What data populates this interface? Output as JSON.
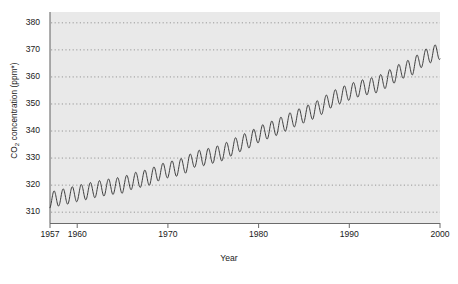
{
  "chart_data": {
    "type": "line",
    "title": "",
    "subtitle": "",
    "xlabel": "Year",
    "ylabel": "CO2 concentration (ppm*)",
    "ylabel_parts": {
      "pre": "CO",
      "sub": "2",
      "post": " concentration (ppm*)"
    },
    "xlim": [
      1957,
      2000
    ],
    "ylim": [
      306,
      384
    ],
    "xticks": [
      1957,
      1960,
      1970,
      1980,
      1990,
      2000
    ],
    "xtick_labels": [
      "1957",
      "1960",
      "1970",
      "1980",
      "1990",
      "2000"
    ],
    "yticks": [
      310,
      320,
      330,
      340,
      350,
      360,
      370,
      380
    ],
    "ytick_labels": [
      "310",
      "320",
      "330",
      "340",
      "350",
      "360",
      "370",
      "380"
    ],
    "grid": "horizontal-dotted",
    "legend": "none",
    "plot_background": "#e9e9e9",
    "line_color": "#3c3c3c",
    "line_width": 1.0,
    "seasonal_amplitude_ppm": 3.0,
    "seasonal_period_years": 1,
    "series": [
      {
        "name": "Mauna Loa atmospheric CO2 (annual mean trend)",
        "x": [
          1957,
          1958,
          1959,
          1960,
          1961,
          1962,
          1963,
          1964,
          1965,
          1966,
          1967,
          1968,
          1969,
          1970,
          1971,
          1972,
          1973,
          1974,
          1975,
          1976,
          1977,
          1978,
          1979,
          1980,
          1981,
          1982,
          1983,
          1984,
          1985,
          1986,
          1987,
          1988,
          1989,
          1990,
          1991,
          1992,
          1993,
          1994,
          1995,
          1996,
          1997,
          1998,
          1999,
          2000
        ],
        "values": [
          314.5,
          315.3,
          316.0,
          316.9,
          317.6,
          318.4,
          319.0,
          319.6,
          320.0,
          321.4,
          322.2,
          323.0,
          324.6,
          325.7,
          326.3,
          327.5,
          329.7,
          330.2,
          331.1,
          332.0,
          333.8,
          335.4,
          336.8,
          338.7,
          340.1,
          341.4,
          343.0,
          344.6,
          346.0,
          347.4,
          349.2,
          351.6,
          353.1,
          354.4,
          355.6,
          356.4,
          357.1,
          358.8,
          360.8,
          362.6,
          363.8,
          366.6,
          368.3,
          369.5
        ]
      }
    ]
  }
}
